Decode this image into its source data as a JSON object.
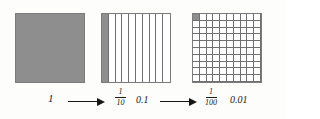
{
  "figure": {
    "background_color": "#fdfdfc",
    "fill_color": "#8e8e8e",
    "line_color": "#707070",
    "text_color": "#1b1b1b"
  },
  "models": [
    {
      "id": "whole",
      "name": "whole-unit-square",
      "divisions": 1,
      "shaded_parts": 1,
      "shaded_fraction": 1,
      "label_value": "1",
      "fraction": null,
      "decimal": null
    },
    {
      "id": "tenths",
      "name": "tenths-strip-square",
      "divisions": 10,
      "shaded_parts": 1,
      "shaded_fraction": 0.1,
      "label_value": null,
      "fraction": {
        "numerator": "1",
        "denominator": "10"
      },
      "decimal": "0.1"
    },
    {
      "id": "hundredths",
      "name": "hundredths-grid-square",
      "divisions": 100,
      "shaded_parts": 1,
      "shaded_fraction": 0.01,
      "label_value": null,
      "fraction": {
        "numerator": "1",
        "denominator": "100"
      },
      "decimal": "0.01"
    }
  ],
  "labels": {
    "one": "1",
    "tenth_numerator": "1",
    "tenth_denominator": "10",
    "tenth_decimal": "0.1",
    "hundredth_numerator": "1",
    "hundredth_denominator": "100",
    "hundredth_decimal": "0.01"
  },
  "arrows": [
    {
      "name": "arrow-unit-to-tenths",
      "direction": "right"
    },
    {
      "name": "arrow-tenths-to-hundredths",
      "direction": "right"
    }
  ]
}
